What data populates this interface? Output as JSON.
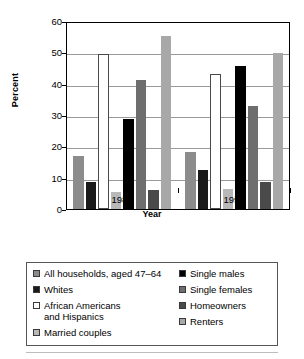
{
  "chart_data": {
    "type": "bar",
    "title": "",
    "xlabel": "Year",
    "ylabel": "Percent",
    "categories": [
      "1989",
      "1998"
    ],
    "ylim": [
      0,
      60
    ],
    "yticks": [
      0,
      10,
      20,
      30,
      40,
      50,
      60
    ],
    "grid": true,
    "legend_position": "bottom",
    "series": [
      {
        "name": "All households, aged 47–64",
        "color": "#8c8c8c",
        "values": [
          17.0,
          18.2
        ]
      },
      {
        "name": "Single males",
        "color": "#1a1a1a",
        "values": [
          8.7,
          12.5
        ]
      },
      {
        "name": "Whites",
        "color": "#ffffff",
        "values": [
          49.5,
          43.0
        ]
      },
      {
        "name": "Single females",
        "color": "#b8b8b8",
        "values": [
          5.5,
          6.3
        ]
      },
      {
        "name": "African Americans\nand Hispanics",
        "color": "#000000",
        "values": [
          28.7,
          45.5
        ]
      },
      {
        "name": "Homeowners",
        "color": "#6e6e6e",
        "values": [
          41.2,
          33.0
        ]
      },
      {
        "name": "Married couples",
        "color": "#4a4a4a",
        "values": [
          6.2,
          8.7
        ]
      },
      {
        "name": "Renters",
        "color": "#a8a8a8",
        "values": [
          55.2,
          49.8
        ]
      }
    ]
  },
  "legend": {
    "left_column": [
      {
        "label": "All households, aged 47–64",
        "swatch": "#8c8c8c"
      },
      {
        "label": "Whites",
        "swatch": "#1a1a1a"
      },
      {
        "label": "African Americans\nand Hispanics",
        "swatch": "#ffffff"
      },
      {
        "label": "Married couples",
        "swatch": "#b8b8b8"
      }
    ],
    "right_column": [
      {
        "label": "Single males",
        "swatch": "#000000"
      },
      {
        "label": "Single females",
        "swatch": "#6e6e6e"
      },
      {
        "label": "Homeowners",
        "swatch": "#4a4a4a"
      },
      {
        "label": "Renters",
        "swatch": "#a8a8a8"
      }
    ]
  },
  "axes": {
    "y_title": "Percent",
    "x_title": "Year",
    "y_ticks": [
      "60",
      "50",
      "40",
      "30",
      "20",
      "10",
      "0"
    ],
    "x_ticks": [
      "1989",
      "1998"
    ]
  }
}
